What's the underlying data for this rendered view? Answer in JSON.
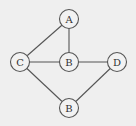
{
  "diagram": {
    "type": "undirected-graph",
    "background": "#efefef",
    "stroke_color": "#555555",
    "node_radius": 9.5,
    "nodes": [
      {
        "id": "n1",
        "label": "A",
        "x": 69,
        "y": 19
      },
      {
        "id": "n2",
        "label": "C",
        "x": 20,
        "y": 62
      },
      {
        "id": "n3",
        "label": "B",
        "x": 69,
        "y": 62
      },
      {
        "id": "n4",
        "label": "D",
        "x": 117,
        "y": 62
      },
      {
        "id": "n5",
        "label": "B",
        "x": 69,
        "y": 108
      }
    ],
    "edges": [
      {
        "from": "n1",
        "to": "n2"
      },
      {
        "from": "n1",
        "to": "n3"
      },
      {
        "from": "n2",
        "to": "n3"
      },
      {
        "from": "n3",
        "to": "n4"
      },
      {
        "from": "n2",
        "to": "n5"
      },
      {
        "from": "n4",
        "to": "n5"
      }
    ]
  }
}
